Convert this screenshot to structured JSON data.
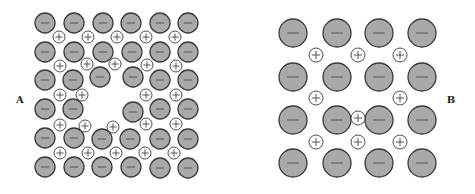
{
  "figure": {
    "width": 475,
    "height": 194,
    "colors": {
      "anion_fill": "#a9a9a9",
      "anion_stroke": "#3a3a3a",
      "cation_fill": "#ffffff",
      "cation_stroke": "#3a3a3a",
      "sign": "#555555"
    },
    "legend_symbols": {
      "anion": "−",
      "cation": "+"
    }
  },
  "panels": [
    {
      "label": "A",
      "label_pos": [
        20,
        103
      ],
      "anion_radius": 10,
      "cation_radius": 6,
      "anions": [
        [
          45,
          23
        ],
        [
          74,
          23
        ],
        [
          103,
          23
        ],
        [
          131,
          23
        ],
        [
          160,
          23
        ],
        [
          188,
          23
        ],
        [
          45,
          52
        ],
        [
          74,
          52
        ],
        [
          103,
          52
        ],
        [
          132,
          52
        ],
        [
          160,
          52
        ],
        [
          188,
          52
        ],
        [
          45,
          80
        ],
        [
          73,
          80
        ],
        [
          100,
          77
        ],
        [
          133,
          77
        ],
        [
          160,
          80
        ],
        [
          188,
          80
        ],
        [
          45,
          109
        ],
        [
          73,
          109
        ],
        [
          133,
          112
        ],
        [
          160,
          109
        ],
        [
          188,
          109
        ],
        [
          45,
          138
        ],
        [
          74,
          138
        ],
        [
          102,
          139
        ],
        [
          130,
          139
        ],
        [
          160,
          139
        ],
        [
          188,
          139
        ],
        [
          45,
          167
        ],
        [
          74,
          167
        ],
        [
          102,
          167
        ],
        [
          131,
          167
        ],
        [
          160,
          168
        ],
        [
          188,
          168
        ]
      ],
      "cations": [
        [
          59,
          37
        ],
        [
          88,
          37
        ],
        [
          117,
          37
        ],
        [
          146,
          37
        ],
        [
          175,
          37
        ],
        [
          60,
          66
        ],
        [
          87,
          64
        ],
        [
          115,
          64
        ],
        [
          147,
          65
        ],
        [
          176,
          66
        ],
        [
          60,
          95
        ],
        [
          82,
          95
        ],
        [
          146,
          95
        ],
        [
          176,
          95
        ],
        [
          60,
          125
        ],
        [
          85,
          126
        ],
        [
          113,
          127
        ],
        [
          146,
          124
        ],
        [
          176,
          124
        ],
        [
          60,
          153
        ],
        [
          88,
          153
        ],
        [
          116,
          153
        ],
        [
          145,
          153
        ],
        [
          174,
          153
        ]
      ]
    },
    {
      "label": "B",
      "label_pos": [
        451,
        103
      ],
      "anion_radius": 14,
      "cation_radius": 7,
      "anions": [
        [
          293,
          33
        ],
        [
          337,
          33
        ],
        [
          379,
          33
        ],
        [
          422,
          33
        ],
        [
          293,
          77
        ],
        [
          337,
          77
        ],
        [
          379,
          77
        ],
        [
          422,
          77
        ],
        [
          293,
          120
        ],
        [
          337,
          120
        ],
        [
          379,
          120
        ],
        [
          422,
          120
        ],
        [
          293,
          163
        ],
        [
          337,
          163
        ],
        [
          379,
          163
        ],
        [
          422,
          163
        ]
      ],
      "cations": [
        [
          316,
          55
        ],
        [
          358,
          55
        ],
        [
          400,
          55
        ],
        [
          316,
          98
        ],
        [
          400,
          98
        ],
        [
          358,
          118
        ],
        [
          316,
          142
        ],
        [
          358,
          142
        ],
        [
          400,
          142
        ]
      ]
    }
  ]
}
